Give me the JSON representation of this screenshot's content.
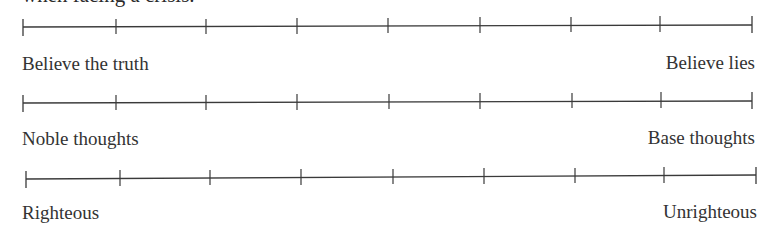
{
  "heading": {
    "clipped_text": "when facing a crisis."
  },
  "scales": [
    {
      "left_label": "Believe the truth",
      "right_label": "Believe lies",
      "tick_count": 9
    },
    {
      "left_label": "Noble thoughts",
      "right_label": "Base thoughts",
      "tick_count": 9
    },
    {
      "left_label": "Righteous",
      "right_label": "Unrighteous",
      "tick_count": 9
    }
  ],
  "colors": {
    "line": "#3a3a3a",
    "text": "#333333",
    "background": "#ffffff"
  }
}
